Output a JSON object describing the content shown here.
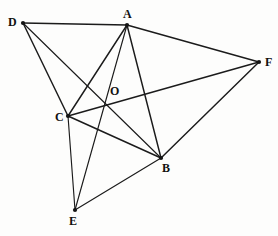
{
  "figure": {
    "width": 278,
    "height": 236,
    "background_color": "#fdfdfc",
    "line_color": "#1b1b1b",
    "label_color": "#111111",
    "points": [
      {
        "id": "D",
        "label": "D",
        "x": 23,
        "y": 23,
        "label_x": 8,
        "label_y": 16
      },
      {
        "id": "A",
        "label": "A",
        "x": 127,
        "y": 25,
        "label_x": 123,
        "label_y": 8
      },
      {
        "id": "F",
        "label": "F",
        "x": 259,
        "y": 62,
        "label_x": 265,
        "label_y": 56
      },
      {
        "id": "O",
        "label": "O",
        "x": 106,
        "y": 105,
        "label_x": 110,
        "label_y": 85
      },
      {
        "id": "C",
        "label": "C",
        "x": 68,
        "y": 116,
        "label_x": 55,
        "label_y": 111
      },
      {
        "id": "B",
        "label": "B",
        "x": 161,
        "y": 158,
        "label_x": 162,
        "label_y": 162
      },
      {
        "id": "E",
        "label": "E",
        "x": 75,
        "y": 210,
        "label_x": 69,
        "label_y": 215
      }
    ],
    "edges": [
      {
        "id": "DA",
        "from": "D",
        "to": "A",
        "weight": "thick"
      },
      {
        "id": "DC",
        "from": "D",
        "to": "C",
        "weight": "thick"
      },
      {
        "id": "DB",
        "from": "D",
        "to": "B",
        "weight": "thin"
      },
      {
        "id": "AF",
        "from": "A",
        "to": "F",
        "weight": "thick"
      },
      {
        "id": "AC",
        "from": "A",
        "to": "C",
        "weight": "thick"
      },
      {
        "id": "AE",
        "from": "A",
        "to": "E",
        "weight": "thin"
      },
      {
        "id": "AB",
        "from": "A",
        "to": "B",
        "weight": "thick"
      },
      {
        "id": "CF",
        "from": "C",
        "to": "F",
        "weight": "thick"
      },
      {
        "id": "CB",
        "from": "C",
        "to": "B",
        "weight": "thick"
      },
      {
        "id": "CE",
        "from": "C",
        "to": "E",
        "weight": "thin"
      },
      {
        "id": "BF",
        "from": "B",
        "to": "F",
        "weight": "thick"
      },
      {
        "id": "BE",
        "from": "B",
        "to": "E",
        "weight": "thin"
      }
    ],
    "vertex_dots": [
      "D",
      "A",
      "F",
      "C",
      "B",
      "E"
    ],
    "intersection_points": [
      "O"
    ]
  }
}
